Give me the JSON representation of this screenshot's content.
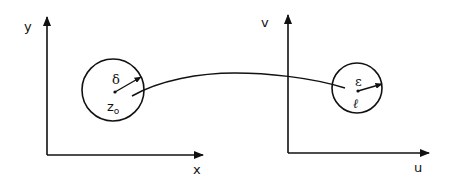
{
  "diagram": {
    "left_plane": {
      "x_axis_label": "x",
      "y_axis_label": "y",
      "disk": {
        "center_label": "z",
        "center_subscript": "o",
        "radius_label": "δ"
      }
    },
    "right_plane": {
      "x_axis_label": "u",
      "y_axis_label": "v",
      "disk": {
        "center_label": "ℓ",
        "radius_label": "ε"
      }
    },
    "mapping_curve": "maps disk around z₀ into disk around ℓ"
  },
  "colors": {
    "stroke": "#111111",
    "background": "#ffffff"
  }
}
